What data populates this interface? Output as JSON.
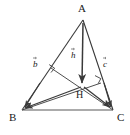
{
  "figure": {
    "background_color": "#ffffff",
    "stroke_color": "#3a3a3a",
    "base_stroke_color": "#8f8f8f",
    "text_color": "#1a1a1a",
    "width": 130,
    "height": 135
  },
  "points": [
    {
      "name": "A",
      "label": "A",
      "x": 83,
      "y": 20,
      "label_x": 78,
      "label_y": 4
    },
    {
      "name": "B",
      "label": "B",
      "x": 22,
      "y": 110,
      "label_x": 9,
      "label_y": 113
    },
    {
      "name": "C",
      "label": "C",
      "x": 113,
      "y": 110,
      "label_x": 117,
      "label_y": 113
    },
    {
      "name": "H",
      "label": "H",
      "x": 82,
      "y": 88,
      "label_x": 77,
      "label_y": 90
    }
  ],
  "vectors": [
    {
      "name": "b",
      "label": "b",
      "from": "H",
      "to": "B",
      "label_x": 33,
      "label_y": 60
    },
    {
      "name": "h",
      "label": "h",
      "from": "A",
      "to": "H",
      "label_x": 71,
      "label_y": 51
    },
    {
      "name": "c",
      "label": "c",
      "from": "H",
      "to": "C",
      "label_x": 103,
      "label_y": 60
    }
  ],
  "segments": [
    {
      "name": "side-AB",
      "from": "A",
      "to": "B",
      "style": "plain"
    },
    {
      "name": "side-AC",
      "from": "A",
      "to": "C",
      "style": "plain"
    },
    {
      "name": "side-BC",
      "from": "B",
      "to": "C",
      "style": "base"
    },
    {
      "name": "altitude-from-B",
      "from": "B",
      "to": "AC",
      "style": "plain"
    },
    {
      "name": "altitude-from-C",
      "from": "C",
      "to": "AB",
      "style": "plain"
    }
  ],
  "right_angles": [
    {
      "name": "right-angle-on-AB",
      "x": 52,
      "y": 68
    },
    {
      "name": "right-angle-on-AC",
      "x": 97,
      "y": 80
    }
  ]
}
